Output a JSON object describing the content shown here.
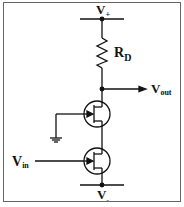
{
  "diagram": {
    "type": "circuit-schematic",
    "labels": {
      "v_plus": {
        "main": "V",
        "sub": "+"
      },
      "v_minus": {
        "main": "V",
        "sub": "-"
      },
      "resistor": {
        "main": "R",
        "sub": "D"
      },
      "output": {
        "main": "V",
        "sub": "out"
      },
      "input": {
        "main": "V",
        "sub": "in"
      }
    },
    "components": [
      {
        "id": "RD",
        "type": "resistor"
      },
      {
        "id": "Q1",
        "type": "n-channel JFET (common gate, gate grounded)"
      },
      {
        "id": "Q2",
        "type": "n-channel JFET (common source, gate = Vin)"
      },
      {
        "id": "GND",
        "type": "ground"
      }
    ],
    "colors": {
      "line": "#111111",
      "frame": "#555555",
      "background": "#ffffff"
    }
  }
}
